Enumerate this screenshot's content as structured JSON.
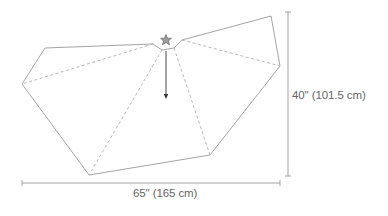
{
  "diagram": {
    "type": "pattern-schematic",
    "shape": "circular tree-skirt segment (partial polygon) with center notch",
    "dimensions": {
      "height_label": "40\" (101.5 cm)",
      "width_label": "65\" (165 cm)"
    },
    "markers": {
      "star": "star-icon",
      "arrow": "down-arrow-icon"
    },
    "colors": {
      "outline": "#9a9a9a",
      "dashed_fold": "#b0b0b0",
      "dimension_line": "#9a9a9a",
      "star_fill": "#9c9c9c",
      "star_stroke": "#6a6a6a",
      "arrow": "#333333",
      "label_text": "#666666"
    }
  }
}
